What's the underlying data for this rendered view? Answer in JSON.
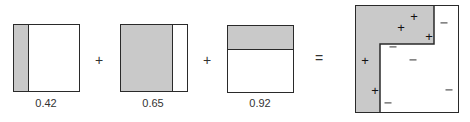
{
  "diagram": {
    "colors": {
      "shade": "#c9c9c9",
      "stroke": "#2a2a2a",
      "background": "#ffffff"
    },
    "weak_learners": [
      {
        "label": "0.42",
        "split": "vertical",
        "shaded_side": "left"
      },
      {
        "label": "0.65",
        "split": "vertical",
        "shaded_side": "left"
      },
      {
        "label": "0.92",
        "split": "horizontal",
        "shaded_side": "top"
      }
    ],
    "operators": {
      "plus1": "+",
      "plus2": "+",
      "equals": "="
    },
    "combined": {
      "positive_symbol": "+",
      "negative_symbol": "−",
      "positive_count": 5,
      "negative_count": 6
    }
  }
}
